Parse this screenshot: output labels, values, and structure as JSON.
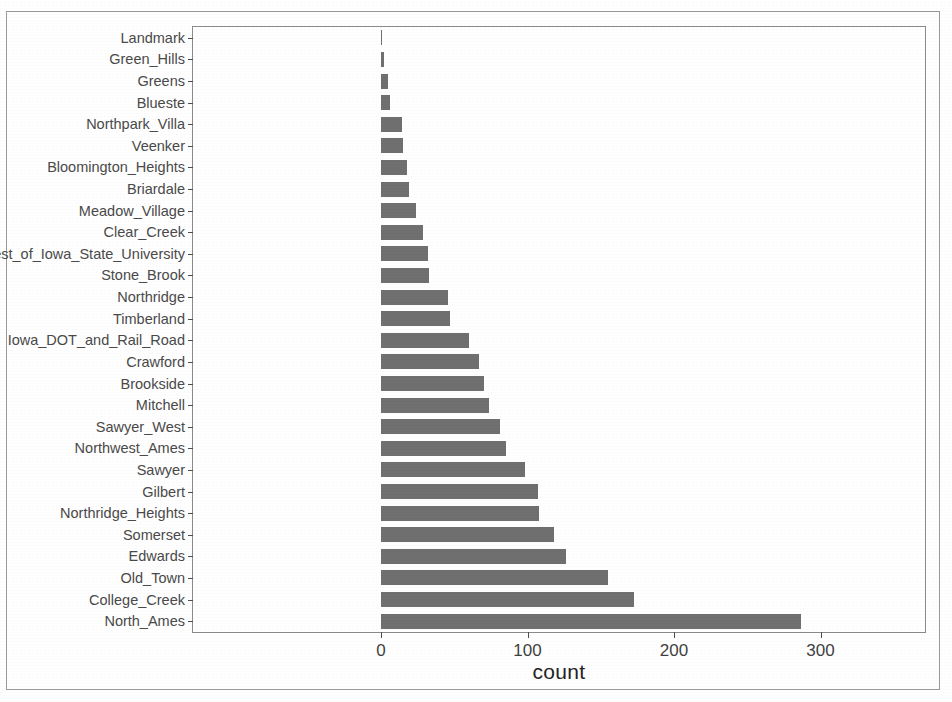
{
  "chart_data": {
    "type": "bar",
    "orientation": "horizontal",
    "title": "",
    "subtitle": "",
    "xlabel": "count",
    "ylabel": "",
    "xlim": [
      0,
      360
    ],
    "ylim": null,
    "grid": false,
    "legend": null,
    "bar_color": "#707070",
    "categories": [
      "Landmark",
      "Green_Hills",
      "Greens",
      "Blueste",
      "Northpark_Villa",
      "Veenker",
      "Bloomington_Heights",
      "Briardale",
      "Meadow_Village",
      "Clear_Creek",
      "South_and_West_of_Iowa_State_University",
      "Stone_Brook",
      "Northridge",
      "Timberland",
      "Iowa_DOT_and_Rail_Road",
      "Crawford",
      "Brookside",
      "Mitchell",
      "Sawyer_West",
      "Northwest_Ames",
      "Sawyer",
      "Gilbert",
      "Northridge_Heights",
      "Somerset",
      "Edwards",
      "Old_Town",
      "College_Creek",
      "North_Ames"
    ],
    "values": [
      1,
      2,
      8,
      10,
      23,
      24,
      28,
      30,
      37,
      44,
      48,
      51,
      71,
      72,
      93,
      103,
      108,
      114,
      125,
      131,
      151,
      165,
      166,
      182,
      194,
      239,
      267,
      443
    ],
    "values_axis_units": [
      1,
      2,
      5,
      6,
      14,
      15,
      18,
      19,
      24,
      29,
      32,
      33,
      46,
      47,
      60,
      67,
      70,
      74,
      81,
      85,
      98,
      107,
      108,
      118,
      126,
      155,
      173,
      287
    ],
    "xticks": [
      0,
      100,
      200,
      300
    ],
    "xticklabels": [
      "0",
      "100",
      "200",
      "300"
    ]
  },
  "axis": {
    "x_title": "count"
  }
}
